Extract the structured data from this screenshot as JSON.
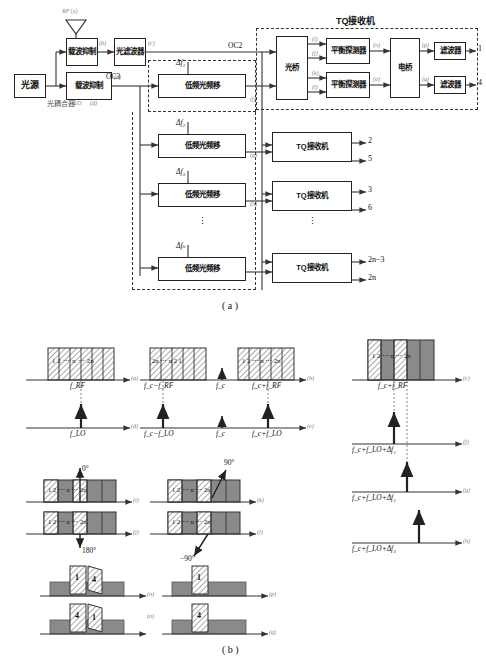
{
  "figure": {
    "caption_a": "( a )",
    "caption_b": "( b )"
  },
  "block_diagram": {
    "title_tq": "TQ接收机",
    "blocks": {
      "light_source": "光源",
      "coupler": "光耦合器",
      "carrier_sup_1": "载波抑制",
      "carrier_sup_2": "载波抑制",
      "optical_filter": "光滤波器",
      "freq_shift": "低频光频移",
      "optical_bridge": "光桥",
      "balanced_detector": "平衡探测器",
      "electrical_bridge": "电桥",
      "filter": "滤波器",
      "tq_receiver": "TQ接收机"
    },
    "port_labels": {
      "rf": "RF",
      "lo": "LO",
      "oc2": "OC2",
      "oc3": "OC3"
    },
    "node_tags": {
      "a": "(a)",
      "b": "(b)",
      "c": "(c)",
      "d": "(d)",
      "e": "(e)",
      "f": "(f)",
      "g": "(g)",
      "h": "(h)",
      "i": "(i)",
      "j": "(j)",
      "k": "(k)",
      "l": "(l)",
      "n": "(n)",
      "o": "(o)",
      "p": "(p)",
      "q": "(q)"
    },
    "delta_labels": [
      "Δf₁",
      "Δf₂",
      "Δf₃",
      "Δfₙ"
    ],
    "outputs": [
      "1",
      "4",
      "2",
      "5",
      "3",
      "6",
      "2n−3",
      "2n"
    ],
    "vertical_dots": "⋮"
  },
  "spectra": {
    "panel_a": {
      "tag": "(a)",
      "axis_label": "f_RF",
      "channels": "1 2 ⋯ n ⋯ 2n"
    },
    "panel_d": {
      "tag": "(d)",
      "axis_label": "f_LO"
    },
    "panel_b": {
      "tag": "(b)",
      "left_label": "f_c−f_RF",
      "center_label": "f_c",
      "right_label": "f_c+f_RF",
      "left_channels": "2n ⋯ n 2 1",
      "right_channels": "1 2 ⋯ n ⋯ 2n"
    },
    "panel_e": {
      "tag": "(e)",
      "left_label": "f_c−f_LO",
      "center_label": "f_c",
      "right_label": "f_c+f_LO"
    },
    "panel_c": {
      "tag": "(c)",
      "axis_label": "f_c+f_RF",
      "channels": "1 2 ⋯ n ⋯ 2n"
    },
    "panel_f": {
      "tag": "(f)",
      "axis_label": "f_c+f_LO+Δf₁"
    },
    "panel_g": {
      "tag": "(g)",
      "axis_label": "f_c+f_LO+Δf₂"
    },
    "panel_h": {
      "tag": "(h)",
      "axis_label": "f_c+f_LO+Δf₃"
    },
    "panel_i": {
      "tag": "(i)",
      "phase": "0°",
      "channels": "1 2 ⋯ n ⋯ 2n"
    },
    "panel_j": {
      "tag": "(j)",
      "phase": "180°",
      "channels": "1 2 ⋯ n ⋯ 2n"
    },
    "panel_k": {
      "tag": "(k)",
      "phase": "90°",
      "channels": "1 2 ⋯ n ⋯ 2n"
    },
    "panel_l": {
      "tag": "(l)",
      "phase": "−90°",
      "channels": "1 2 ⋯ n ⋯ 2n"
    },
    "panel_n": {
      "tag": "(n)",
      "front": "1",
      "back": "4"
    },
    "panel_o": {
      "tag": "(o)",
      "front": "4",
      "back": "1"
    },
    "panel_p": {
      "tag": "(p)",
      "front": "1"
    },
    "panel_q": {
      "tag": "(q)",
      "front": "4"
    }
  },
  "colors": {
    "line": "#333333",
    "tag": "#7a7a7a",
    "gray_fill": "#8a8a8a",
    "hatch": "#ffffff"
  }
}
